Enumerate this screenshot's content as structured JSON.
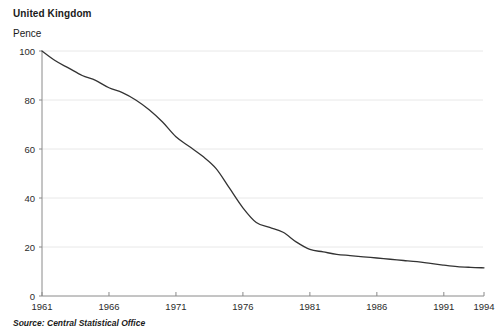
{
  "chart_title": "United Kingdom",
  "y_axis_label": "Pence",
  "source_note": "Source: Central Statistical Office",
  "chart_data": {
    "type": "line",
    "title": "United Kingdom",
    "subtitle": "",
    "xlabel": "",
    "ylabel": "Pence",
    "xlim": [
      1961,
      1994
    ],
    "ylim": [
      0,
      100
    ],
    "grid": true,
    "legend": "none",
    "line_color": "#333333",
    "gridline_color": "#e8e8e8",
    "axis_color": "#808080",
    "x_ticks": [
      1961,
      1966,
      1971,
      1976,
      1981,
      1986,
      1991,
      1994
    ],
    "x_tick_labels": [
      "1961",
      "1966",
      "1971",
      "1976",
      "1981",
      "1986",
      "1991",
      "1994"
    ],
    "y_ticks": [
      0,
      20,
      40,
      60,
      80,
      100
    ],
    "y_tick_labels": [
      "0",
      "20",
      "40",
      "60",
      "80",
      "100"
    ],
    "x": [
      1961,
      1962,
      1963,
      1964,
      1965,
      1966,
      1967,
      1968,
      1969,
      1970,
      1971,
      1972,
      1973,
      1974,
      1975,
      1976,
      1977,
      1978,
      1979,
      1980,
      1981,
      1982,
      1983,
      1984,
      1985,
      1986,
      1987,
      1988,
      1989,
      1990,
      1991,
      1992,
      1993,
      1994
    ],
    "values": [
      100,
      96,
      93,
      90,
      88,
      85,
      83,
      80,
      76,
      71,
      65,
      61,
      57,
      52,
      44,
      36,
      30,
      28,
      26,
      22,
      19,
      18,
      17,
      16.5,
      16,
      15.5,
      15,
      14.5,
      14,
      13.3,
      12.6,
      12,
      11.7,
      11.5
    ],
    "series": [
      {
        "name": "Value of the pound",
        "values": [
          100,
          96,
          93,
          90,
          88,
          85,
          83,
          80,
          76,
          71,
          65,
          61,
          57,
          52,
          44,
          36,
          30,
          28,
          26,
          22,
          19,
          18,
          17,
          16.5,
          16,
          15.5,
          15,
          14.5,
          14,
          13.3,
          12.6,
          12,
          11.7,
          11.5
        ]
      }
    ]
  }
}
